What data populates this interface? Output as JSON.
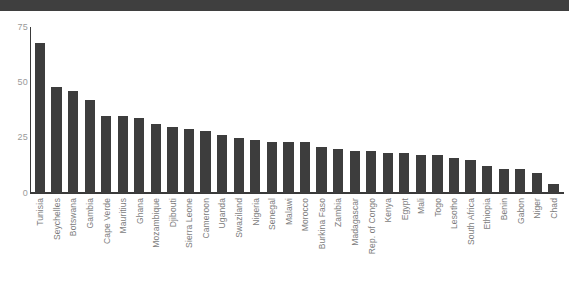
{
  "chart_data": {
    "type": "bar",
    "title": "",
    "subtitle": "",
    "xlabel": "",
    "ylabel": "",
    "ylim": [
      0,
      75
    ],
    "yticks": [
      0,
      25,
      50,
      75
    ],
    "ytick_labels": [
      "0",
      "25",
      "50",
      "75"
    ],
    "grid": false,
    "legend": null,
    "bar_color": "#3d3d3d",
    "axis_color": "#3a3a3a",
    "tick_label_color": "#9a9a9a",
    "category_label_color": "#7d7d7d",
    "categories": [
      "Tunisia",
      "Seychelles",
      "Botswana",
      "Gambia",
      "Cape Verde",
      "Mauritius",
      "Ghana",
      "Mozambique",
      "Djibouti",
      "Sierra Leone",
      "Cameroon",
      "Uganda",
      "Swaziland",
      "Nigeria",
      "Senegal",
      "Malawi",
      "Morocco",
      "Burkina Faso",
      "Zambia",
      "Madagascar",
      "Rep. of Congo",
      "Kenya",
      "Egypt",
      "Mali",
      "Togo",
      "Lesotho",
      "South Africa",
      "Ethiopia",
      "Benin",
      "Gabon",
      "Niger",
      "Chad"
    ],
    "values": [
      68,
      48,
      46,
      42,
      35,
      35,
      34,
      31,
      30,
      29,
      28,
      26,
      25,
      24,
      23,
      23,
      23,
      21,
      20,
      19,
      19,
      18,
      18,
      17,
      17,
      16,
      15,
      12,
      11,
      11,
      9,
      4
    ]
  },
  "page": {
    "top_band_color": "#3f3f3f",
    "background_color": "#ffffff"
  }
}
